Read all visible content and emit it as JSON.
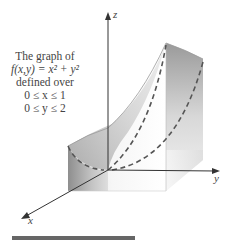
{
  "figure": {
    "caption": {
      "line1": "The graph of",
      "line2": "f(x,y) = x² + y²",
      "line3": "defined over",
      "line4": "0 ≤ x ≤ 1",
      "line5": "0 ≤ y ≤ 2"
    },
    "axes": {
      "x_label": "x",
      "y_label": "y",
      "z_label": "z"
    },
    "function": "f(x,y) = x^2 + y^2",
    "domain": {
      "x": [
        0,
        1
      ],
      "y": [
        0,
        2
      ]
    },
    "colors": {
      "axis": "#333333",
      "surface_dark": "#8a8a8a",
      "surface_light": "#f2f2f2",
      "dashed_curve": "#555555",
      "bar": "#666666",
      "text": "#444444"
    }
  }
}
